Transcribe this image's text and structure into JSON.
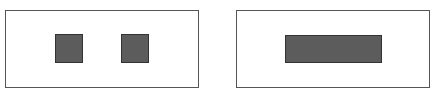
{
  "diagram": {
    "panels": [
      {
        "name": "left-panel",
        "frame": {
          "x": 5,
          "y": 10,
          "w": 194,
          "h": 78
        },
        "blocks": [
          {
            "name": "left-square-1",
            "x": 55,
            "y": 34,
            "w": 28,
            "h": 29
          },
          {
            "name": "left-square-2",
            "x": 121,
            "y": 34,
            "w": 28,
            "h": 29
          }
        ]
      },
      {
        "name": "right-panel",
        "frame": {
          "x": 236,
          "y": 10,
          "w": 194,
          "h": 78
        },
        "blocks": [
          {
            "name": "right-bar",
            "x": 285,
            "y": 35,
            "w": 97,
            "h": 28
          }
        ]
      }
    ],
    "colors": {
      "frame_border": "#555555",
      "block_fill": "#5c5c5c",
      "block_border": "#333333",
      "background": "#ffffff"
    }
  }
}
